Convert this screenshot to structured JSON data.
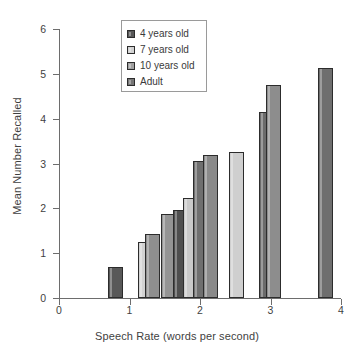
{
  "chart_data": {
    "type": "bar",
    "title": "",
    "xlabel": "Speech Rate (words per second)",
    "ylabel": "Mean Number Recalled",
    "xlim": [
      0,
      4
    ],
    "ylim": [
      0,
      6
    ],
    "xticks": [
      "0",
      "1",
      "2",
      "3",
      "4"
    ],
    "yticks": [
      "0",
      "1",
      "2",
      "3",
      "4",
      "5",
      "6"
    ],
    "grid": false,
    "legend_position": "top-center",
    "legend": [
      {
        "label": "4 years old",
        "color": "#585858"
      },
      {
        "label": "7 years old",
        "color": "#d2d2d2"
      },
      {
        "label": "10 years old",
        "color": "#a0a0a0"
      },
      {
        "label": "Adult",
        "color": "#767676"
      }
    ],
    "series": [
      {
        "name": "4 years old",
        "color": "#585858",
        "points": [
          {
            "x": 0.8,
            "y": 0.7
          },
          {
            "x": 1.72,
            "y": 1.96
          }
        ]
      },
      {
        "name": "7 years old",
        "color": "#d2d2d2",
        "points": [
          {
            "x": 1.22,
            "y": 1.24
          },
          {
            "x": 1.87,
            "y": 2.22
          },
          {
            "x": 2.52,
            "y": 3.25
          }
        ]
      },
      {
        "name": "10 years old",
        "color": "#a0a0a0",
        "points": [
          {
            "x": 1.33,
            "y": 1.43
          },
          {
            "x": 1.55,
            "y": 1.88
          },
          {
            "x": 2.15,
            "y": 3.2
          },
          {
            "x": 3.04,
            "y": 4.76
          }
        ]
      },
      {
        "name": "Adult",
        "color": "#767676",
        "points": [
          {
            "x": 2.0,
            "y": 3.06
          },
          {
            "x": 2.94,
            "y": 4.15
          },
          {
            "x": 3.78,
            "y": 5.12
          }
        ]
      }
    ],
    "bars": [
      {
        "x": 0.8,
        "value": 0.7,
        "series": "4 years old",
        "color": "#585858"
      },
      {
        "x": 1.22,
        "value": 1.24,
        "series": "7 years old",
        "color": "#d2d2d2"
      },
      {
        "x": 1.33,
        "value": 1.43,
        "series": "10 years old",
        "color": "#8f8f8f"
      },
      {
        "x": 1.55,
        "value": 1.88,
        "series": "10 years old",
        "color": "#949494"
      },
      {
        "x": 1.72,
        "value": 1.96,
        "series": "4 years old",
        "color": "#4e4e4e"
      },
      {
        "x": 1.87,
        "value": 2.22,
        "series": "7 years old",
        "color": "#c9c9c9"
      },
      {
        "x": 2.0,
        "value": 3.06,
        "series": "Adult",
        "color": "#6f6f6f"
      },
      {
        "x": 2.15,
        "value": 3.2,
        "series": "10 years old",
        "color": "#8a8a8a"
      },
      {
        "x": 2.52,
        "value": 3.25,
        "series": "7 years old",
        "color": "#cfcfcf"
      },
      {
        "x": 2.94,
        "value": 4.15,
        "series": "Adult",
        "color": "#6b6b6b"
      },
      {
        "x": 3.04,
        "value": 4.76,
        "series": "10 years old",
        "color": "#8d8d8d"
      },
      {
        "x": 3.78,
        "value": 5.12,
        "series": "Adult",
        "color": "#6e6e6e"
      }
    ]
  },
  "axis": {
    "x_title": "Speech Rate (words per second)",
    "y_title": "Mean Number Recalled"
  }
}
